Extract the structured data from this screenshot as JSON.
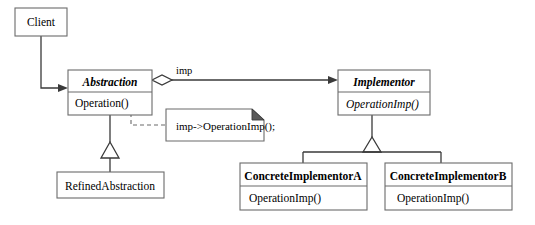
{
  "diagram": {
    "background_color": "#ffffff",
    "box_stroke_color": "#6b6b6b",
    "line_color": "#3a3a3a",
    "text_color": "#000000"
  },
  "classes": {
    "client": {
      "name": "Client",
      "style": "plain"
    },
    "abstraction": {
      "name": "Abstraction",
      "style": "italic-bold",
      "operations": [
        "Operation()"
      ]
    },
    "refined_abstraction": {
      "name": "RefinedAbstraction",
      "style": "plain"
    },
    "implementor": {
      "name": "Implementor",
      "style": "italic-bold",
      "operations": [
        "OperationImp()"
      ]
    },
    "concrete_implementor_a": {
      "name": "ConcreteImplementorA",
      "style": "bold",
      "operations": [
        "OperationImp()"
      ]
    },
    "concrete_implementor_b": {
      "name": "ConcreteImplementorB",
      "style": "bold",
      "operations": [
        "OperationImp()"
      ]
    }
  },
  "relationships": {
    "client_to_abstraction": {
      "type": "association",
      "label": ""
    },
    "abstraction_to_implementor": {
      "type": "aggregation",
      "label": "imp",
      "diamond": "hollow"
    },
    "refined_inherits_abstraction": {
      "type": "generalization"
    },
    "concrete_a_inherits_implementor": {
      "type": "generalization"
    },
    "concrete_b_inherits_implementor": {
      "type": "generalization"
    }
  },
  "note": {
    "text": "imp->OperationImp();",
    "attached_to": "Operation()",
    "connector": "dashed"
  }
}
